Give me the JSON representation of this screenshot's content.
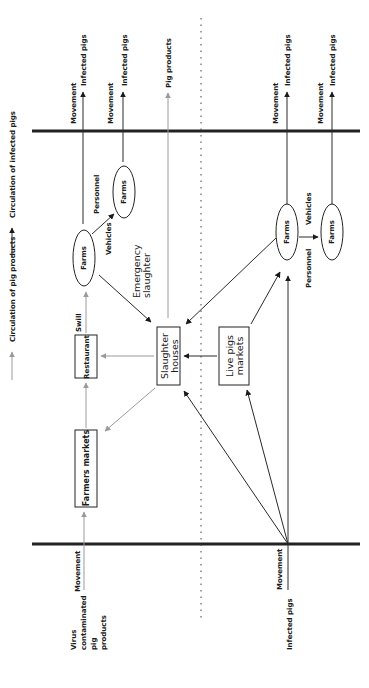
{
  "legend": {
    "products": {
      "label": "Circulation of pig products",
      "color": "#9a9a9a"
    },
    "infected": {
      "label": "Circulation of infected pigs",
      "color": "#1a1a1a"
    }
  },
  "orientation": "rotated 90° counter-clockwise",
  "sections": {
    "top_outputs": [
      {
        "movement": "Movement",
        "label": "Infected pigs"
      },
      {
        "movement": "Movement",
        "label": "Infected pigs"
      },
      {
        "movement": "",
        "label": "Pig products"
      },
      {
        "movement": "Movement",
        "label": "Infected pigs"
      },
      {
        "movement": "Movement",
        "label": "Infected pigs"
      }
    ],
    "bottom_inputs": {
      "products": {
        "label_lines": [
          "Virus",
          "contaminated",
          "pig",
          "products"
        ],
        "movement": "Movement"
      },
      "pigs": {
        "label": "Infected pigs",
        "movement": "Movement"
      }
    }
  },
  "nodes": {
    "farms_left_a": "Farms",
    "farms_left_b": "Farms",
    "farms_right_a": "Farms",
    "farms_right_b": "Farms",
    "restaurant": "Restaurant",
    "farmers_markets": "Farmers markets",
    "slaughter_line1": "Slaughter",
    "slaughter_line2": "houses",
    "live_line1": "Live pigs",
    "live_line2": "markets"
  },
  "edge_labels": {
    "swill": "Swill",
    "personnel_left": "Personnel",
    "vehicles_left": "Vehicles",
    "emergency_line1": "Emergency",
    "emergency_line2": "slaughter",
    "vehicles_right": "Vehicles",
    "personnel_right": "Personnel"
  }
}
